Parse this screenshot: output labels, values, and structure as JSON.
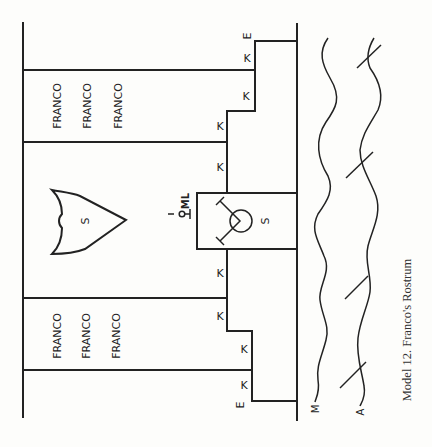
{
  "caption": "Model 12.  Franco's Rostrum",
  "banners": {
    "top": [
      "FRANCO",
      "FRANCO",
      "FRANCO"
    ],
    "bottom": [
      "FRANCO",
      "FRANCO",
      "FRANCO"
    ]
  },
  "shield_label": "S",
  "box_label": "S",
  "mic_label": "ML",
  "step_labels": {
    "k": "K",
    "e": "E"
  },
  "wave_labels": {
    "m": "M",
    "a": "A"
  }
}
